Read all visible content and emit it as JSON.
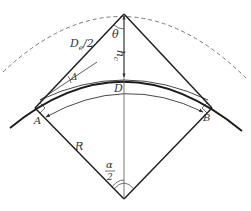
{
  "diagram": {
    "type": "geometry",
    "colors": {
      "line": "#1a1a1a",
      "thin": "#555555",
      "dashed": "#777777",
      "text": "#333333"
    },
    "labels": {
      "theta": "θ",
      "de_half_main": "D",
      "de_half_sub": "e",
      "de_half_rest": "/2",
      "hc_main": "h",
      "hc_sub": "c",
      "delta": "Δ",
      "D": "D",
      "A": "A",
      "B": "B",
      "R": "R",
      "alpha_num": "α",
      "alpha_den": "2"
    }
  }
}
